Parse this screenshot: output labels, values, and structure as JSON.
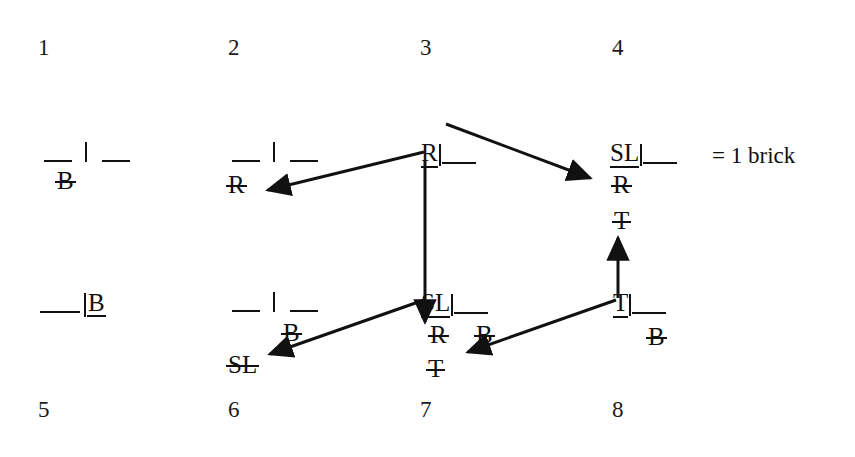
{
  "diagram": {
    "title_text": "",
    "legend": {
      "text": "= 1 brick",
      "symbol_cell": "SL|__"
    },
    "ink_color": "#111111",
    "background_color": "#ffffff",
    "states": [
      {
        "number": "1",
        "head": {
          "letters": "",
          "glyph": "__|__"
        },
        "labels": [
          {
            "text": "B",
            "decoration": "strike",
            "position": "below-right"
          }
        ]
      },
      {
        "number": "2",
        "head": {
          "letters": "",
          "glyph": "__|__"
        },
        "labels": [
          {
            "text": "R",
            "decoration": "strike",
            "position": "below-left"
          }
        ]
      },
      {
        "number": "3",
        "head": {
          "letters": "R",
          "glyph": "R|__",
          "underline": true
        },
        "labels": []
      },
      {
        "number": "4",
        "head": {
          "letters": "SL",
          "glyph": "SL|__",
          "underline": true
        },
        "labels": [
          {
            "text": "R",
            "decoration": "strike",
            "position": "below"
          },
          {
            "text": "T",
            "decoration": "strike",
            "position": "below"
          }
        ]
      },
      {
        "number": "5",
        "head": {
          "letters": "B",
          "glyph": "__|B",
          "underline": true
        },
        "labels": []
      },
      {
        "number": "6",
        "head": {
          "letters": "",
          "glyph": "__|__"
        },
        "labels": [
          {
            "text": "B",
            "decoration": "strike",
            "position": "below-right"
          },
          {
            "text": "SL",
            "decoration": "strike",
            "position": "below-left"
          }
        ]
      },
      {
        "number": "7",
        "head": {
          "letters": "SL",
          "glyph": "SL|__",
          "underline": true
        },
        "labels": [
          {
            "text": "R",
            "decoration": "strike",
            "position": "below-left"
          },
          {
            "text": "B",
            "decoration": "strike",
            "position": "below-right"
          },
          {
            "text": "T",
            "decoration": "strike",
            "position": "below"
          }
        ]
      },
      {
        "number": "8",
        "head": {
          "letters": "T",
          "glyph": "T|__",
          "underline": true
        },
        "labels": [
          {
            "text": "B",
            "decoration": "strike",
            "position": "below-right"
          }
        ]
      }
    ],
    "transitions": [
      {
        "from": "3",
        "to": "2",
        "direction": "left"
      },
      {
        "from": "3",
        "to": "4",
        "direction": "down-right"
      },
      {
        "from": "3",
        "to": "7",
        "direction": "down"
      },
      {
        "from": "7",
        "to": "6",
        "direction": "down-left"
      },
      {
        "from": "8",
        "to": "7",
        "direction": "down-left"
      },
      {
        "from": "8",
        "to": "4",
        "direction": "up"
      }
    ]
  }
}
